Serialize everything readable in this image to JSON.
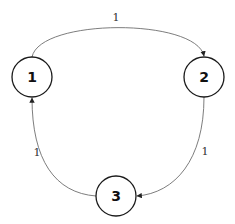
{
  "diagram": {
    "type": "directed-graph",
    "nodes": [
      {
        "id": "1",
        "label": "1",
        "cx": 32,
        "cy": 77,
        "r": 20
      },
      {
        "id": "2",
        "label": "2",
        "cx": 204,
        "cy": 77,
        "r": 20
      },
      {
        "id": "3",
        "label": "3",
        "cx": 116,
        "cy": 196,
        "r": 20
      }
    ],
    "edges": [
      {
        "from": "1",
        "to": "2",
        "label": "1"
      },
      {
        "from": "2",
        "to": "3",
        "label": "1"
      },
      {
        "from": "3",
        "to": "1",
        "label": "1"
      }
    ]
  },
  "colors": {
    "node_stroke": "#1a1a1a",
    "edge_stroke": "#6e6e6e",
    "background": "#ffffff"
  }
}
